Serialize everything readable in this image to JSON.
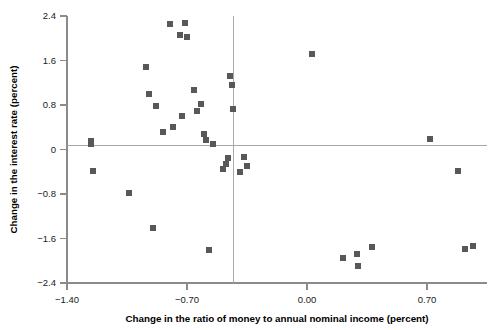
{
  "chart_data": {
    "type": "scatter",
    "title": "",
    "xlabel": "Change in the ratio of money to annual nominal income (percent)",
    "ylabel": "Change in the interest rate (percent)",
    "xlim": [
      -1.4,
      1.05
    ],
    "ylim": [
      -2.4,
      2.4
    ],
    "xticks": [
      -1.4,
      -0.7,
      0.0,
      0.7
    ],
    "xticklabels": [
      "−1.40",
      "−0.70",
      "0.00",
      "0.70"
    ],
    "yticks": [
      -2.4,
      -1.6,
      -0.8,
      0,
      0.8,
      1.6,
      2.4
    ],
    "yticklabels": [
      "−2.4",
      "−1.6",
      "−0.8",
      "0",
      "0.8",
      "1.6",
      "2.4"
    ],
    "grid": false,
    "legend": null,
    "marker": "square",
    "marker_color": "#585858",
    "marker_size": 6,
    "reference_lines": {
      "horizontal": 0.07,
      "vertical": -0.43
    },
    "points": [
      {
        "x": -1.26,
        "y": 0.16
      },
      {
        "x": -1.26,
        "y": 0.09
      },
      {
        "x": -1.25,
        "y": -0.39
      },
      {
        "x": -1.04,
        "y": -0.79
      },
      {
        "x": -0.94,
        "y": 1.48
      },
      {
        "x": -0.92,
        "y": 0.99
      },
      {
        "x": -0.9,
        "y": -1.42
      },
      {
        "x": -0.88,
        "y": 0.78
      },
      {
        "x": -0.84,
        "y": 0.31
      },
      {
        "x": -0.8,
        "y": 2.26
      },
      {
        "x": -0.78,
        "y": 0.4
      },
      {
        "x": -0.74,
        "y": 2.06
      },
      {
        "x": -0.73,
        "y": 0.6
      },
      {
        "x": -0.71,
        "y": 2.28
      },
      {
        "x": -0.7,
        "y": 2.03
      },
      {
        "x": -0.66,
        "y": 1.07
      },
      {
        "x": -0.64,
        "y": 0.7
      },
      {
        "x": -0.62,
        "y": 0.81
      },
      {
        "x": -0.6,
        "y": 0.27
      },
      {
        "x": -0.59,
        "y": 0.17
      },
      {
        "x": -0.57,
        "y": -1.81
      },
      {
        "x": -0.55,
        "y": 0.09
      },
      {
        "x": -0.49,
        "y": -0.35
      },
      {
        "x": -0.47,
        "y": -0.26
      },
      {
        "x": -0.46,
        "y": -0.15
      },
      {
        "x": -0.45,
        "y": 1.33
      },
      {
        "x": -0.44,
        "y": 1.16
      },
      {
        "x": -0.43,
        "y": 0.72
      },
      {
        "x": -0.39,
        "y": -0.41
      },
      {
        "x": -0.37,
        "y": -0.13
      },
      {
        "x": -0.35,
        "y": -0.29
      },
      {
        "x": 0.03,
        "y": 1.72
      },
      {
        "x": 0.21,
        "y": -1.95
      },
      {
        "x": 0.29,
        "y": -1.87
      },
      {
        "x": 0.3,
        "y": -2.1
      },
      {
        "x": 0.38,
        "y": -1.76
      },
      {
        "x": 0.72,
        "y": 0.18
      },
      {
        "x": 0.88,
        "y": -0.38
      },
      {
        "x": 0.92,
        "y": -1.78
      },
      {
        "x": 0.97,
        "y": -1.73
      }
    ]
  }
}
